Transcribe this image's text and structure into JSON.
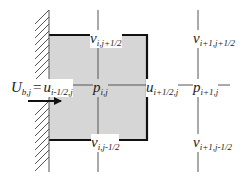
{
  "diagram": {
    "type": "staggered-grid-boundary-cell",
    "colors": {
      "cell_fill": "#d6d6d6",
      "cell_edge": "#111111",
      "grid_line": "#555555",
      "wall_hatch": "#555555",
      "text": "#222222"
    },
    "labels": {
      "v_top_center": {
        "main": "v",
        "sub": "i,j+1/2"
      },
      "v_top_right": {
        "main": "v",
        "sub": "i+1,j+1/2"
      },
      "boundary_U": {
        "main": "U",
        "sub": "b,j"
      },
      "equals": "=",
      "u_left": {
        "main": "u",
        "sub": "i-1/2,j"
      },
      "p_center": {
        "main": "p",
        "sub": "i,j"
      },
      "u_right": {
        "main": "u",
        "sub": "i+1/2,j"
      },
      "p_right": {
        "main": "p",
        "sub": "i+1,j"
      },
      "v_bottom_center": {
        "main": "v",
        "sub": "i,j-1/2"
      },
      "v_bottom_right": {
        "main": "v",
        "sub": "i+1,j-1/2"
      }
    },
    "elements": {
      "wall": "hatched solid wall on left boundary",
      "cell": "shaded control volume (i,j) adjacent to wall",
      "arrow": "inflow velocity arrow pointing right into cell"
    }
  }
}
